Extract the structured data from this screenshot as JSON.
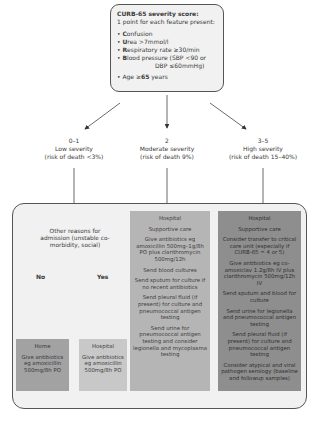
{
  "score_box": {
    "title": "CURB-65 severity score:",
    "subtitle": "1 point for each feature present:",
    "items": [
      {
        "letter": "C",
        "rest": "onfusion"
      },
      {
        "letter": "U",
        "rest": "rea >7mmol/l"
      },
      {
        "letter": "R",
        "rest": "espiratory rate ≥30/min"
      },
      {
        "letter": "B",
        "rest": "lood pressure (SBP <90 or"
      },
      {
        "letter": "",
        "rest": "DBP ≤60mmHg)"
      }
    ],
    "age": {
      "prefix": "Age ≥",
      "bold": "65",
      "suffix": " years"
    }
  },
  "severity": [
    {
      "score": "0–1",
      "label": "Low severity",
      "risk": "(risk of death <3%)"
    },
    {
      "score": "2",
      "label": "Moderate severity",
      "risk": "(risk of death 9%)"
    },
    {
      "score": "3–5",
      "label": "High severity",
      "risk": "(risk of death 15–40%)"
    }
  ],
  "low": {
    "question": "Other reasons for admission (unstable co-morbidity, social)",
    "no_label": "No",
    "yes_label": "Yes",
    "home": {
      "title": "Home",
      "text": "Give antibiotics eg amoxicillin 500mg/8h PO"
    },
    "hospital": {
      "title": "Hospital",
      "text": "Give antibiotics eg amoxicillin 500mg/8h PO"
    }
  },
  "moderate": {
    "items": [
      "Hospital",
      "Supportive care",
      "Give antibiotics eg amoxicillin 500mg–1g/8h PO plus clarithromycin 500mg/12h",
      "Send blood cultures",
      "Send sputum for culture if no recent antibiotics",
      "Send pleural fluid (if present) for culture and pneumococcal antigen testing",
      "Send urine for pneumococcal antigen testing and consider legionella and mycoplasma testing"
    ]
  },
  "high": {
    "items": [
      "Hospital",
      "Supportive care",
      "Consider transfer to critical care unit (especially if CURB-65 = 4 or 5)",
      "Give antibiotics eg co-amoxiclav 1.2g/8h IV plus clarithromycin 500mg/12h IV",
      "Send sputum and blood for culture",
      "Send urine for legionella and pneumococcal antigen testing",
      "Send pleural fluid (if present) for culture and pneumococcal antigen testing",
      "Consider atypical and viral pathogen serology (baseline and followup samples)"
    ]
  }
}
